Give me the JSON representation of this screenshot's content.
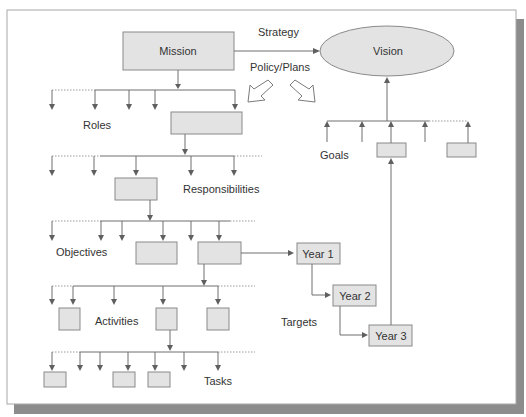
{
  "diagram": {
    "nodes": {
      "mission": "Mission",
      "vision": "Vision",
      "year1": "Year 1",
      "year2": "Year 2",
      "year3": "Year 3"
    },
    "labels": {
      "strategy": "Strategy",
      "policy_plans": "Policy/Plans",
      "roles": "Roles",
      "responsibilities": "Responsibilities",
      "objectives": "Objectives",
      "activities": "Activities",
      "tasks": "Tasks",
      "goals": "Goals",
      "targets": "Targets"
    },
    "levels": [
      "Mission",
      "Roles",
      "Responsibilities",
      "Objectives",
      "Activities",
      "Tasks"
    ],
    "targets_sequence": [
      "Year 1",
      "Year 2",
      "Year 3"
    ],
    "colors": {
      "box_fill": "#e3e3e3",
      "box_stroke": "#8a8a8a",
      "line": "#6f6f6f",
      "shadow": "#8c8c8c"
    }
  }
}
